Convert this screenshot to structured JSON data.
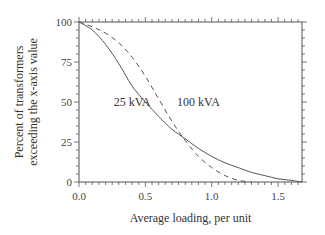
{
  "chart_data": {
    "type": "line",
    "title": "",
    "xlabel": "Average loading, per unit",
    "ylabel_lines": [
      "Percent of transformers",
      "exceeding the x-axis value"
    ],
    "xlim": [
      0,
      1.68
    ],
    "ylim": [
      0,
      100
    ],
    "x_ticks": [
      "0.0",
      "0.5",
      "1.0",
      "1.5"
    ],
    "y_ticks": [
      "0",
      "25",
      "50",
      "75",
      "100"
    ],
    "grid": false,
    "legend": "inline labels",
    "series": [
      {
        "name": "25 kVA",
        "style": "solid",
        "x": [
          0,
          0.1,
          0.2,
          0.3,
          0.4,
          0.5,
          0.6,
          0.7,
          0.8,
          0.9,
          1.0,
          1.1,
          1.2,
          1.3,
          1.4,
          1.5,
          1.6,
          1.68
        ],
        "y": [
          100,
          95,
          86,
          74,
          60,
          50,
          41,
          33,
          27,
          21,
          16,
          12,
          9,
          6,
          4,
          2,
          1,
          0
        ]
      },
      {
        "name": "100 kVA",
        "style": "dashed",
        "x": [
          0,
          0.1,
          0.2,
          0.3,
          0.4,
          0.5,
          0.6,
          0.7,
          0.8,
          0.9,
          1.0,
          1.1,
          1.2,
          1.3
        ],
        "y": [
          100,
          97,
          93,
          87,
          78,
          66,
          52,
          38,
          26,
          16,
          9,
          4,
          1,
          0
        ]
      }
    ],
    "annotations": [
      {
        "text": "25 kVA",
        "x": 0.4,
        "y": 50
      },
      {
        "text": "100 kVA",
        "x": 0.9,
        "y": 50
      }
    ]
  }
}
